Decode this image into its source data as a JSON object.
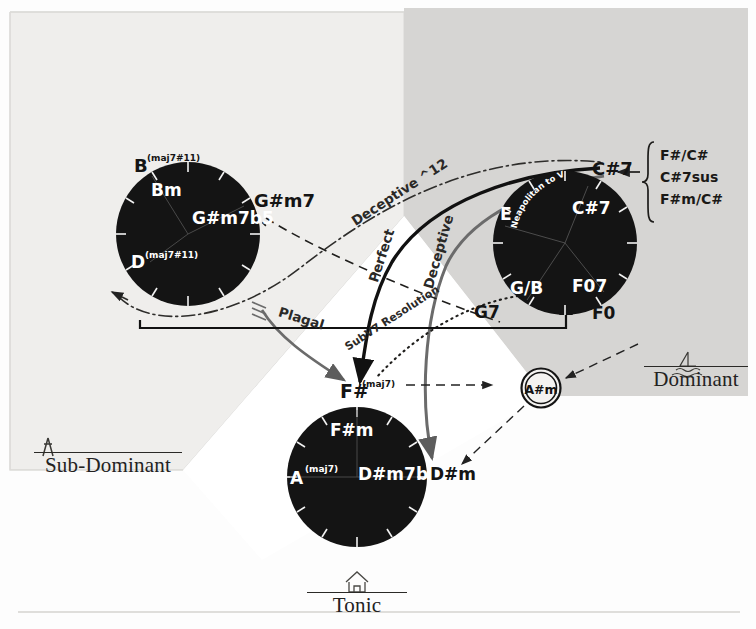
{
  "diagram": {
    "type": "music-theory-function-diagram",
    "background": "#fdfdfd",
    "region_fill": "#d6d5d3",
    "circle_fill": "#141414",
    "text_on_circle": "#ffffff"
  },
  "regions": [
    {
      "id": "sub-dominant",
      "label": "Sub-Dominant",
      "icon": "tent-icon",
      "fill": "#efeeec"
    },
    {
      "id": "dominant",
      "label": "Dominant",
      "icon": "sailboat-waves-icon",
      "fill": "#d6d5d3"
    },
    {
      "id": "tonic",
      "label": "Tonic",
      "icon": "house-icon",
      "fill": "#ffffff"
    }
  ],
  "circles": [
    {
      "id": "sub-dominant-circle",
      "function": "Sub-Dominant",
      "cx": 188,
      "cy": 234,
      "r": 72,
      "inside_labels": [
        {
          "text": "Bm",
          "x": 163,
          "y": 190,
          "size": 16
        },
        {
          "text": "G#m7b5",
          "x": 196,
          "y": 218,
          "size": 16
        },
        {
          "text": "D",
          "x": 136,
          "y": 262,
          "size": 16,
          "sup": "(maj7#11)"
        }
      ],
      "outside_labels": [
        {
          "text": "B",
          "x": 134,
          "y": 166,
          "size": 16,
          "sup": "(maj7#11)"
        },
        {
          "text": "G#m7",
          "x": 258,
          "y": 204,
          "size": 16
        }
      ]
    },
    {
      "id": "dominant-circle",
      "function": "Dominant",
      "cx": 565,
      "cy": 243,
      "r": 72,
      "inside_labels": [
        {
          "text": "E",
          "x": 506,
          "y": 214,
          "size": 16
        },
        {
          "text": "C#7",
          "x": 576,
          "y": 208,
          "size": 16
        },
        {
          "text": "G/B",
          "x": 520,
          "y": 290,
          "size": 16
        },
        {
          "text": "F07",
          "x": 579,
          "y": 288,
          "size": 16
        }
      ],
      "outside_labels": [
        {
          "text": "C#7",
          "x": 596,
          "y": 169,
          "size": 17
        },
        {
          "text": "G7",
          "x": 478,
          "y": 312,
          "size": 16
        },
        {
          "text": "F0",
          "x": 596,
          "y": 313,
          "size": 16
        }
      ],
      "curved_note": "Neapolitan to V7..."
    },
    {
      "id": "tonic-circle",
      "function": "Tonic",
      "cx": 357,
      "cy": 477,
      "r": 70,
      "inside_labels": [
        {
          "text": "F#m",
          "x": 337,
          "y": 430,
          "size": 16
        },
        {
          "text": "A",
          "x": 294,
          "y": 477,
          "size": 16,
          "sup": "(maj7)"
        },
        {
          "text": "D#m7b5",
          "x": 363,
          "y": 473,
          "size": 16
        }
      ],
      "outside_labels": [
        {
          "text": "F#",
          "x": 347,
          "y": 391,
          "size": 17,
          "sup": "(maj7)"
        },
        {
          "text": "D#m",
          "x": 434,
          "y": 475,
          "size": 16
        }
      ]
    }
  ],
  "pivot_chord": {
    "id": "pivot-chord-node",
    "text": "A#m",
    "cx": 541,
    "cy": 388,
    "r": 19,
    "style": "double-circle"
  },
  "annotation_box": {
    "id": "dominant-substitutions",
    "arrow": "left-arrow",
    "items": [
      "F#/C#",
      "C#7sus",
      "F#m/C#"
    ]
  },
  "motion_labels": [
    {
      "id": "deceptive-12",
      "text": "Deceptive ^12",
      "x": 402,
      "y": 196,
      "rot": -33
    },
    {
      "id": "perfect",
      "text": "Perfect",
      "x": 386,
      "y": 257,
      "rot": -72
    },
    {
      "id": "deceptive",
      "text": "Deceptive",
      "x": 443,
      "y": 253,
      "rot": -74
    },
    {
      "id": "plagal",
      "text": "Plagal",
      "x": 300,
      "y": 323,
      "rot": 17
    },
    {
      "id": "subv7-resolution",
      "text": "SubV7 Resolution",
      "x": 394,
      "y": 321,
      "rot": -33
    }
  ],
  "arrows": [
    {
      "id": "sd-to-t-plagal",
      "style": "solid-gray",
      "from": "Sub-Dominant",
      "to": "Tonic"
    },
    {
      "id": "d-to-t-perfect",
      "style": "solid-black",
      "from": "Dominant",
      "to": "Tonic (F#)"
    },
    {
      "id": "d-to-t-deceptive",
      "style": "solid-gray",
      "from": "Dominant",
      "to": "Tonic (D#m)"
    },
    {
      "id": "sd-to-d-deceptive12",
      "style": "dash-dot",
      "from": "Sub-Dominant",
      "to": "Dominant"
    },
    {
      "id": "gsharp-m7-to-g7",
      "style": "dashed",
      "from": "G#m7",
      "to": "G7"
    },
    {
      "id": "subv7-dotted",
      "style": "dotted",
      "from": "Dominant",
      "to": "F#"
    },
    {
      "id": "fsharp-to-pivot",
      "style": "dashed",
      "from": "F#",
      "to": "A#m"
    },
    {
      "id": "pivot-to-dsharp-m",
      "style": "dashed",
      "from": "A#m",
      "to": "D#m"
    },
    {
      "id": "dominant-region-to-pivot",
      "style": "dashed",
      "from": "Dominant region",
      "to": "A#m"
    },
    {
      "id": "bracket-up-to-dominant",
      "style": "solid-black-bracket",
      "from": "Sub-Dominant",
      "to": "Dominant"
    }
  ]
}
